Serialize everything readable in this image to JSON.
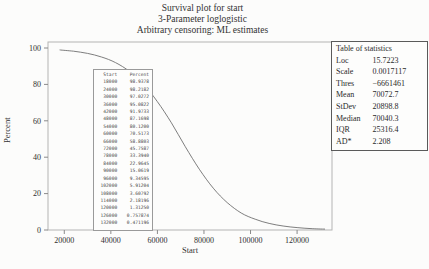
{
  "title": {
    "line1": "Survival plot for start",
    "line2": "3-Parameter loglogistic",
    "line3": "Arbitrary censoring: ML estimates"
  },
  "chart_data": {
    "type": "line",
    "title": "Survival plot for start",
    "subtitle": "3-Parameter loglogistic; Arbitrary censoring: ML estimates",
    "xlabel": "Start",
    "ylabel": "Percent",
    "xlim": [
      13000,
      135000
    ],
    "ylim": [
      0,
      100
    ],
    "x_ticks": [
      20000,
      40000,
      60000,
      80000,
      100000,
      120000
    ],
    "y_ticks": [
      0,
      20,
      40,
      60,
      80,
      100
    ],
    "grid": false,
    "legend": "none",
    "series": [
      {
        "name": "3-parameter-loglogistic-survival",
        "x": [
          18000,
          24000,
          30000,
          36000,
          42000,
          48000,
          54000,
          60000,
          66000,
          72000,
          78000,
          84000,
          90000,
          96000,
          102000,
          108000,
          114000,
          120000,
          126000,
          132000
        ],
        "y": [
          98.9378,
          98.2182,
          97.0272,
          95.0822,
          91.9733,
          87.1698,
          80.12,
          70.5173,
          58.8803,
          45.7587,
          33.394,
          22.9645,
          15.0619,
          9.34595,
          5.91204,
          3.60792,
          2.18196,
          1.3125,
          0.757874,
          0.471196
        ]
      }
    ]
  },
  "annotation_table": {
    "headers": [
      "Start",
      "Percent"
    ],
    "rows": [
      [
        "18000",
        "98.9378"
      ],
      [
        "24000",
        "98.2182"
      ],
      [
        "30000",
        "97.0272"
      ],
      [
        "36000",
        "95.0822"
      ],
      [
        "42000",
        "91.9733"
      ],
      [
        "48000",
        "87.1698"
      ],
      [
        "54000",
        "80.1200"
      ],
      [
        "60000",
        "70.5173"
      ],
      [
        "66000",
        "58.8803"
      ],
      [
        "72000",
        "45.7587"
      ],
      [
        "78000",
        "33.3940"
      ],
      [
        "84000",
        "22.9645"
      ],
      [
        "90000",
        "15.0619"
      ],
      [
        "96000",
        "9.34595"
      ],
      [
        "102000",
        "5.91204"
      ],
      [
        "108000",
        "3.60792"
      ],
      [
        "114000",
        "2.18196"
      ],
      [
        "120000",
        "1.31250"
      ],
      [
        "126000",
        "0.757874"
      ],
      [
        "132000",
        "0.471196"
      ]
    ]
  },
  "stats_table": {
    "title": "Table of statistics",
    "rows": [
      {
        "label": "Loc",
        "value": "15.7223"
      },
      {
        "label": "Scale",
        "value": "0.0017117"
      },
      {
        "label": "Thres",
        "value": "−6661461"
      },
      {
        "label": "Mean",
        "value": "70072.7"
      },
      {
        "label": "StDev",
        "value": "20898.8"
      },
      {
        "label": "Median",
        "value": "70040.3"
      },
      {
        "label": "IQR",
        "value": "25316.4"
      },
      {
        "label": "AD*",
        "value": "2.208"
      }
    ]
  },
  "colors": {
    "curve": "#6f6f6f",
    "frame": "#b4b4b4",
    "tick": "#8a8a8a",
    "text": "#2f2f2f"
  }
}
